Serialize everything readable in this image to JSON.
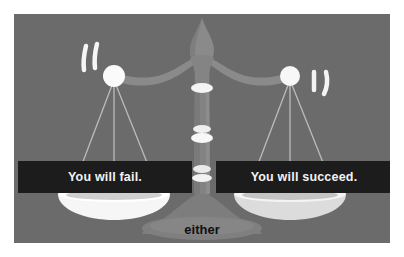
{
  "image": {
    "title": "Balance scale illustration with two outcome captions",
    "background_color": "#ffffff",
    "panel_color": "#6b6b6b"
  },
  "scale": {
    "colors": {
      "background": "#6b6b6b",
      "frame": "#878787",
      "frame_dark": "#5f5f5f",
      "highlight": "#f4f4f4",
      "string": "#bdbdbd",
      "pan": "#fbfbfb",
      "pan_shadow": "#cfcfcf",
      "caption_bg": "#1c1c1c",
      "caption_text": "#f2f2f2",
      "base_text": "#111111"
    },
    "parts": {
      "finial": "finial-ornament",
      "beam": "balance-beam",
      "column": "center-column",
      "base": "pedestal-base",
      "left_ball": "left-pivot-ball",
      "right_ball": "right-pivot-ball",
      "left_pan": "left-pan",
      "right_pan": "right-pan"
    },
    "motion_marks": {
      "left_count": 2,
      "right_count": 2
    },
    "strings_per_side": 3
  },
  "captions": {
    "left": {
      "text": "You will fail.",
      "name": "caption-left"
    },
    "right": {
      "text": "You will succeed.",
      "name": "caption-right"
    }
  },
  "base_label": {
    "text": "either"
  }
}
